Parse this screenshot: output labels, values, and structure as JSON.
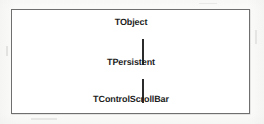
{
  "figure": {
    "type": "class-hierarchy-diagram",
    "frame": {
      "border_color": "#6f6f6f",
      "fill_color": "#ffffff"
    },
    "nodes": [
      {
        "id": "tobject",
        "label": "TObject"
      },
      {
        "id": "tpersistent",
        "label": "TPersistent"
      },
      {
        "id": "tcontrolscrollbar",
        "label": "TControlScrollBar"
      }
    ],
    "edges": [
      {
        "from": "TObject",
        "to": "TPersistent",
        "style": "vertical-line",
        "color": "#2b2b2b"
      },
      {
        "from": "TPersistent",
        "to": "TControlScrollBar",
        "style": "vertical-line",
        "color": "#2b2b2b"
      }
    ],
    "text_color": "#1d1d1d",
    "background_color": "#fbfbfa"
  }
}
